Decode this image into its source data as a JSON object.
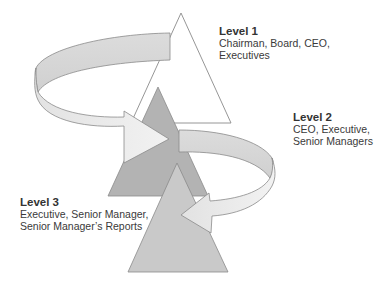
{
  "diagram": {
    "levels": [
      {
        "title": "Level 1",
        "lines": [
          "Chairman, Board, CEO,",
          "Executives"
        ],
        "color": "#ffffff"
      },
      {
        "title": "Level 2",
        "lines": [
          "CEO, Executive,",
          "Senior Managers"
        ],
        "color": "#b0b0b0"
      },
      {
        "title": "Level 3",
        "lines": [
          "Executive, Senior Manager,",
          "Senior Manager’s Reports"
        ],
        "color": "#c8c8c8"
      }
    ],
    "arrows": [
      {
        "from": "Level 1",
        "to": "Level 2",
        "color": "#e6e6e6"
      },
      {
        "from": "Level 2",
        "to": "Level 3",
        "color": "#e6e6e6"
      }
    ]
  }
}
